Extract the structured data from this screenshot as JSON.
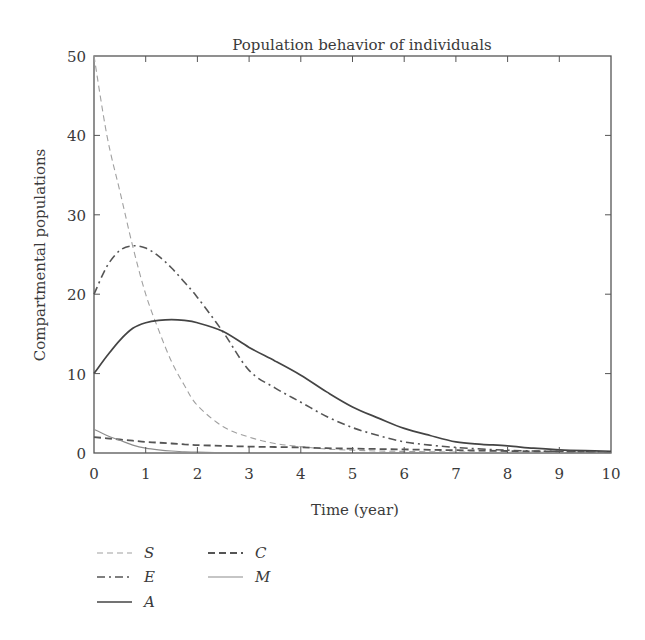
{
  "chart_data": {
    "type": "line",
    "title": "Population behavior of individuals",
    "xlabel": "Time (year)",
    "ylabel": "Compartmental populations",
    "xlim": [
      0,
      10
    ],
    "ylim": [
      0,
      50
    ],
    "xticks": [
      0,
      1,
      2,
      3,
      4,
      5,
      6,
      7,
      8,
      9,
      10
    ],
    "yticks": [
      0,
      10,
      20,
      30,
      40,
      50
    ],
    "grid": false,
    "legend_position": "below-left",
    "x": [
      0,
      0.25,
      0.5,
      0.75,
      1,
      1.25,
      1.5,
      1.75,
      2,
      2.5,
      3,
      3.5,
      4,
      4.5,
      5,
      5.5,
      6,
      6.5,
      7,
      7.5,
      8,
      8.5,
      9,
      9.5,
      10
    ],
    "series": [
      {
        "name": "S",
        "style": "dashed-thin",
        "color": "#9a9a9a",
        "values": [
          50,
          40,
          33,
          26,
          20,
          15.5,
          11.5,
          8.5,
          6.0,
          3.3,
          2.0,
          1.2,
          0.8,
          0.5,
          0.35,
          0.25,
          0.2,
          0.15,
          0.12,
          0.1,
          0.1,
          0.08,
          0.07,
          0.06,
          0.05
        ]
      },
      {
        "name": "E",
        "style": "dash-dot",
        "color": "#5a5a5a",
        "values": [
          20,
          23.5,
          25.5,
          26.1,
          25.8,
          24.8,
          23.3,
          21.5,
          19.6,
          15.2,
          10.4,
          8.2,
          6.4,
          4.6,
          3.2,
          2.2,
          1.4,
          1.0,
          0.7,
          0.5,
          0.35,
          0.25,
          0.2,
          0.15,
          0.1
        ]
      },
      {
        "name": "A",
        "style": "solid",
        "color": "#4a4a4a",
        "values": [
          10,
          12.2,
          14.2,
          15.7,
          16.4,
          16.7,
          16.8,
          16.7,
          16.4,
          15.3,
          13.3,
          11.6,
          9.8,
          7.7,
          5.8,
          4.4,
          3.1,
          2.2,
          1.4,
          1.1,
          0.9,
          0.6,
          0.4,
          0.3,
          0.2
        ]
      },
      {
        "name": "C",
        "style": "dashed",
        "color": "#5a5a5a",
        "values": [
          2.0,
          1.85,
          1.7,
          1.55,
          1.4,
          1.3,
          1.2,
          1.1,
          1.0,
          0.9,
          0.8,
          0.75,
          0.7,
          0.6,
          0.55,
          0.5,
          0.45,
          0.4,
          0.35,
          0.3,
          0.25,
          0.2,
          0.2,
          0.15,
          0.15
        ]
      },
      {
        "name": "M",
        "style": "solid-thin",
        "color": "#8a8a8a",
        "values": [
          3.0,
          2.2,
          1.6,
          1.0,
          0.6,
          0.4,
          0.25,
          0.15,
          0.1,
          0.05,
          0.03,
          0.02,
          0.01,
          0,
          0,
          0,
          0,
          0,
          0,
          0,
          0,
          0,
          0,
          0,
          0
        ]
      }
    ]
  },
  "legend": {
    "items": [
      {
        "label": "S",
        "style": "dashed-thin",
        "col": 0,
        "row": 0
      },
      {
        "label": "E",
        "style": "dash-dot",
        "col": 0,
        "row": 1
      },
      {
        "label": "A",
        "style": "solid",
        "col": 0,
        "row": 2
      },
      {
        "label": "C",
        "style": "dashed",
        "col": 1,
        "row": 0
      },
      {
        "label": "M",
        "style": "solid-thin",
        "col": 1,
        "row": 1
      }
    ]
  }
}
